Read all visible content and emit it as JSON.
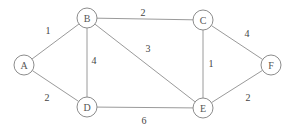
{
  "graph": {
    "type": "undirected-weighted",
    "node_radius": 10,
    "nodes": [
      {
        "id": "A",
        "label": "A",
        "x": 24,
        "y": 65
      },
      {
        "id": "B",
        "label": "B",
        "x": 87,
        "y": 18
      },
      {
        "id": "C",
        "label": "C",
        "x": 203,
        "y": 20
      },
      {
        "id": "D",
        "label": "D",
        "x": 87,
        "y": 107
      },
      {
        "id": "E",
        "label": "E",
        "x": 203,
        "y": 108
      },
      {
        "id": "F",
        "label": "F",
        "x": 271,
        "y": 65
      }
    ],
    "edges": [
      {
        "from": "A",
        "to": "B",
        "weight": "1",
        "label_x": 48,
        "label_y": 30
      },
      {
        "from": "A",
        "to": "D",
        "weight": "2",
        "label_x": 47,
        "label_y": 97
      },
      {
        "from": "B",
        "to": "C",
        "weight": "2",
        "label_x": 143,
        "label_y": 12
      },
      {
        "from": "B",
        "to": "D",
        "weight": "4",
        "label_x": 94,
        "label_y": 60
      },
      {
        "from": "B",
        "to": "E",
        "weight": "3",
        "label_x": 148,
        "label_y": 48
      },
      {
        "from": "C",
        "to": "E",
        "weight": "1",
        "label_x": 211,
        "label_y": 63
      },
      {
        "from": "C",
        "to": "F",
        "weight": "4",
        "label_x": 247,
        "label_y": 33
      },
      {
        "from": "D",
        "to": "E",
        "weight": "6",
        "label_x": 144,
        "label_y": 120
      },
      {
        "from": "E",
        "to": "F",
        "weight": "2",
        "label_x": 248,
        "label_y": 97
      }
    ]
  },
  "colors": {
    "background": "#ffffff",
    "edge": "#9a9a9a",
    "node_stroke": "#8c8c8c",
    "text": "#555555"
  }
}
